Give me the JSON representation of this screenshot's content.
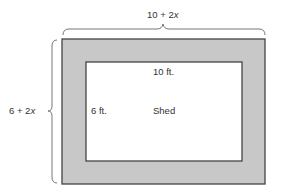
{
  "diagram": {
    "outer_width_label_prefix": "10 + 2",
    "outer_width_label_var": "x",
    "outer_height_label_prefix": "6 + 2",
    "outer_height_label_var": "x",
    "inner_width_label": "10 ft.",
    "inner_height_label": "6 ft.",
    "inner_label": "Shed",
    "colors": {
      "border_fill": "#c8c8c8",
      "stroke": "#444444",
      "inner_fill": "#ffffff",
      "brace": "#666666"
    }
  }
}
